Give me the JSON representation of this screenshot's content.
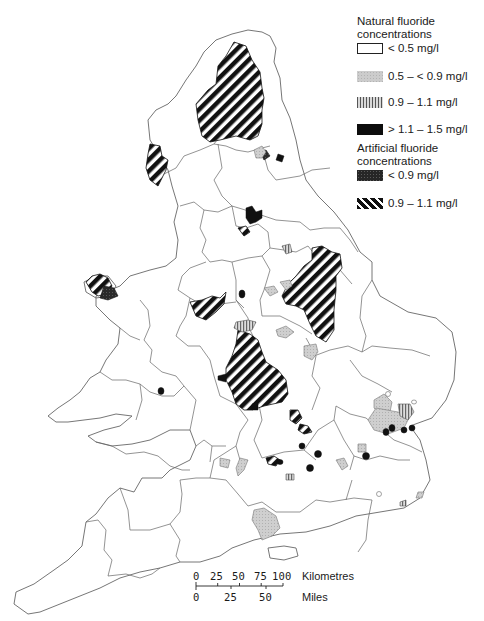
{
  "legend": {
    "natural_title_line1": "Natural fluoride",
    "natural_title_line2": "concentrations",
    "natural_items": [
      {
        "label": "< 0.5 mg/l",
        "pattern": "white-outline"
      },
      {
        "label": "0.5 – < 0.9 mg/l",
        "pattern": "light-grey-stipple"
      },
      {
        "label": "0.9 – 1.1 mg/l",
        "pattern": "vertical-hatch"
      },
      {
        "label": "> 1.1 – 1.5 mg/l",
        "pattern": "solid-black"
      }
    ],
    "artificial_title_line1": "Artificial fluoride",
    "artificial_title_line2": "concentrations",
    "artificial_items": [
      {
        "label": "< 0.9 mg/l",
        "pattern": "dark-stipple"
      },
      {
        "label": "0.9 – 1.1 mg/l",
        "pattern": "diagonal-stripes"
      }
    ]
  },
  "scale_bar": {
    "km_ticks": [
      "0",
      "25",
      "50",
      "75",
      "100"
    ],
    "km_unit": "Kilometres",
    "mile_ticks": [
      "0",
      "25",
      "50"
    ],
    "mile_unit": "Miles"
  },
  "colors": {
    "boundary": "#555555",
    "light_grey": "#c8c8c8",
    "dark_fill": "#111111",
    "background": "#ffffff"
  }
}
